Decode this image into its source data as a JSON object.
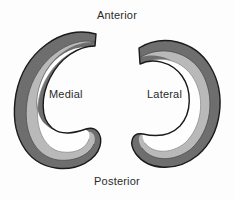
{
  "figure": {
    "background_color": "#fdfdfd",
    "width": 234,
    "height": 200
  },
  "orientation_labels": {
    "anterior": "Anterior",
    "posterior": "Posterior"
  },
  "menisci": [
    {
      "id": "medial",
      "label": "Medial",
      "opening_direction": "right",
      "bands": [
        {
          "name": "outer-rim",
          "color": "#6e6e6e"
        },
        {
          "name": "middle-zone",
          "color": "#b9b9b9"
        },
        {
          "name": "inner-zone",
          "color": "#fefefe"
        }
      ]
    },
    {
      "id": "lateral",
      "label": "Lateral",
      "opening_direction": "left",
      "bands": [
        {
          "name": "outer-rim",
          "color": "#6e6e6e"
        },
        {
          "name": "middle-zone",
          "color": "#b9b9b9"
        },
        {
          "name": "inner-zone",
          "color": "#fefefe"
        }
      ]
    }
  ],
  "colors": {
    "outline": "#1a1a1a",
    "outer_band": "#6e6e6e",
    "middle_band": "#b9b9b9",
    "inner_band": "#fefefe",
    "text": "#2a2a2a",
    "background": "#fdfdfd"
  }
}
